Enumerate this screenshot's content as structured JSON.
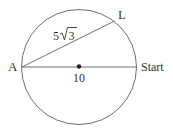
{
  "diagram": {
    "type": "circle-geometry",
    "circle": {
      "cx": 79,
      "cy": 67,
      "r": 57.5,
      "stroke": "#707070"
    },
    "points": {
      "A": {
        "label": "A",
        "x": 22,
        "y": 67
      },
      "start": {
        "label": "Start",
        "x": 136.5,
        "y": 67
      },
      "L": {
        "label": "L",
        "x": 114.5,
        "y": 21
      },
      "center": {
        "x": 79,
        "y": 66
      }
    },
    "segments": [
      {
        "from": "A",
        "to": "start",
        "label": "10",
        "description": "diameter"
      },
      {
        "from": "A",
        "to": "L",
        "label_prefix": "5",
        "label_radical": "3",
        "description": "chord AL"
      }
    ],
    "labels": {
      "A": "A",
      "L": "L",
      "start": "Start",
      "diameter": "10",
      "chord_coef": "5",
      "chord_radicand": "3"
    },
    "colors": {
      "line": "#707070",
      "text": "#333333",
      "dot": "#222222"
    }
  }
}
